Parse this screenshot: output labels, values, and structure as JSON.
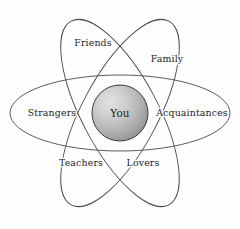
{
  "diagram": {
    "type": "concentric-orbit",
    "background_color": "#fefefe",
    "nucleus": {
      "label": "You",
      "center_x": 120,
      "center_y": 113,
      "radius": 28,
      "fill_highlight_color": "#dedede",
      "fill_mid_color": "#bdbdbd",
      "fill_shadow_color": "#949494",
      "stroke_color": "#3a3a3a"
    },
    "orbits": [
      {
        "name": "horizontal-orbit",
        "rx": 110,
        "ry": 38,
        "rotation": 0,
        "stroke_color": "#4a4a4a"
      },
      {
        "name": "diagonal-orbit-right",
        "rx": 38,
        "ry": 104,
        "rotation": 28,
        "stroke_color": "#4a4a4a"
      },
      {
        "name": "diagonal-orbit-left",
        "rx": 38,
        "ry": 104,
        "rotation": -28,
        "stroke_color": "#4a4a4a"
      }
    ],
    "labels": [
      {
        "id": "friends",
        "text": "Friends",
        "x": 93,
        "y": 43
      },
      {
        "id": "family",
        "text": "Family",
        "x": 167,
        "y": 59
      },
      {
        "id": "strangers",
        "text": "Strangers",
        "x": 52,
        "y": 113
      },
      {
        "id": "acquaintances",
        "text": "Acquaintances",
        "x": 192,
        "y": 113
      },
      {
        "id": "teachers",
        "text": "Teachers",
        "x": 81,
        "y": 163
      },
      {
        "id": "lovers",
        "text": "Lovers",
        "x": 143,
        "y": 163
      }
    ]
  }
}
